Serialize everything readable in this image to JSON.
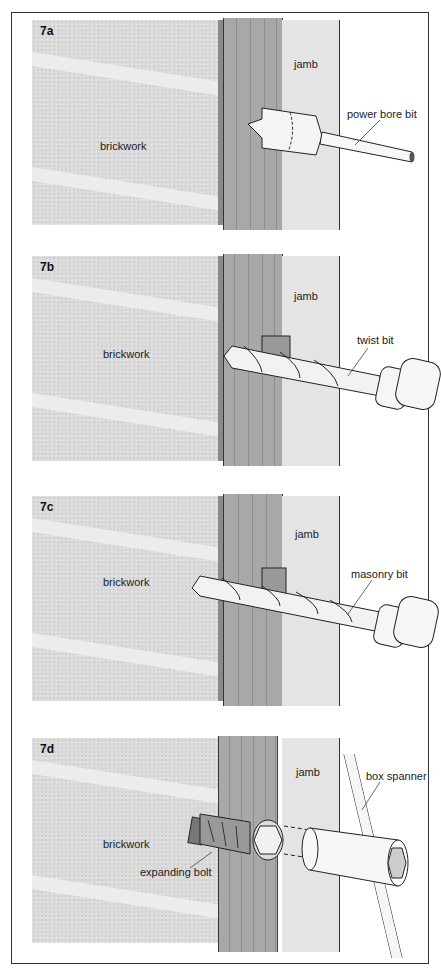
{
  "figure": {
    "panels": [
      {
        "id": "7a",
        "labels": {
          "brick": "brickwork",
          "jamb": "jamb",
          "tool": "power bore bit"
        }
      },
      {
        "id": "7b",
        "labels": {
          "brick": "brickwork",
          "jamb": "jamb",
          "tool": "twist bit"
        }
      },
      {
        "id": "7c",
        "labels": {
          "brick": "brickwork",
          "jamb": "jamb",
          "tool": "masonry bit"
        }
      },
      {
        "id": "7d",
        "labels": {
          "brick": "brickwork",
          "jamb": "jamb",
          "tool": "box spanner",
          "fixing": "expanding bolt"
        }
      }
    ]
  },
  "colors": {
    "brick": "#dcdcdc",
    "mortar": "#ececec",
    "wood": "#a8a8a8",
    "jamb": "#e4e4e4",
    "line": "#333333"
  }
}
